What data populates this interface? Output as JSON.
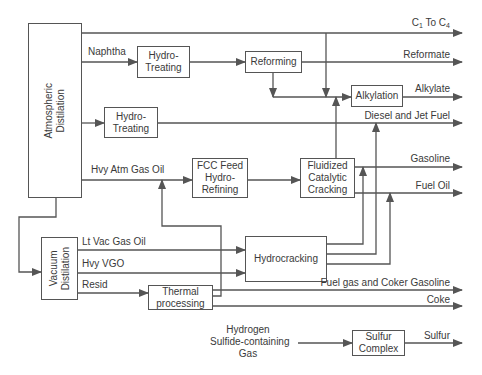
{
  "diagram": {
    "type": "refinery-process-flow",
    "units": {
      "atmospheric": "Atmospheric Distilation",
      "atmospheric_line1": "Atmospheric",
      "atmospheric_line2": "Distilation",
      "hydrotreating1_line1": "Hydro-",
      "hydrotreating1_line2": "Treating",
      "hydrotreating2_line1": "Hydro-",
      "hydrotreating2_line2": "Treating",
      "reforming": "Reforming",
      "alkylation": "Alkylation",
      "fcc_feed_line1": "FCC Feed",
      "fcc_feed_line2": "Hydro-",
      "fcc_feed_line3": "Refining",
      "fcc_line1": "Fluidized",
      "fcc_line2": "Catalytic",
      "fcc_line3": "Cracking",
      "vacuum_line1": "Vacuum",
      "vacuum_line2": "Distilation",
      "hydrocracking": "Hydrocracking",
      "thermal_line1": "Thermal",
      "thermal_line2": "processing",
      "sulfur_line1": "Sulfur",
      "sulfur_line2": "Complex"
    },
    "streams": {
      "naphtha": "Naphtha",
      "hvy_atm_gas_oil": "Hvy Atm Gas Oil",
      "lt_vac_gas_oil": "Lt Vac Gas Oil",
      "hvy_vgo": "Hvy VGO",
      "resid": "Resid",
      "h2s_line1": "Hydrogen",
      "h2s_line2": "Sulfide-containing",
      "h2s_line3": "Gas"
    },
    "products": {
      "c1_to_c4_prefix": "C",
      "c1_sub": "1",
      "c1_to_c4_mid": " To C",
      "c4_sub": "4",
      "reformate": "Reformate",
      "alkylate": "Alkylate",
      "diesel_jet": "Diesel and Jet Fuel",
      "gasoline": "Gasoline",
      "fuel_oil": "Fuel Oil",
      "fuel_gas_coker": "Fuel gas and Coker Gasoline",
      "coke": "Coke",
      "sulfur": "Sulfur"
    },
    "colors": {
      "line": "#555555",
      "text": "#3a3a3a",
      "background": "#ffffff"
    }
  }
}
